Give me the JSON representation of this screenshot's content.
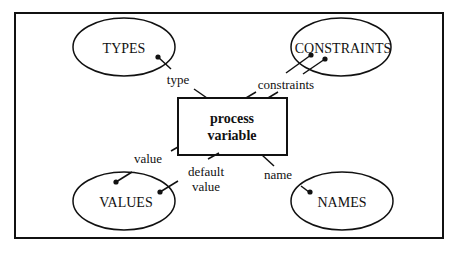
{
  "diagram": {
    "center": {
      "line1": "process",
      "line2": "variable"
    },
    "nodes": {
      "types": "TYPES",
      "constraints": "CONSTRAINTS",
      "values": "VALUES",
      "names": "NAMES"
    },
    "edges": {
      "type": "type",
      "constraints": "constraints",
      "value": "value",
      "default_line1": "default",
      "default_line2": "value",
      "name": "name"
    },
    "colors": {
      "ink": "#111111",
      "background": "#ffffff"
    }
  }
}
